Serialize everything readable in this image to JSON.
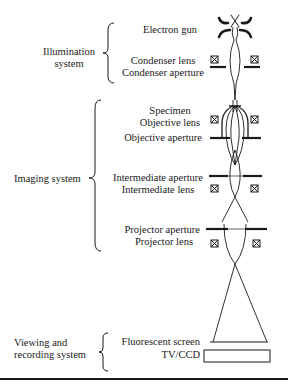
{
  "diagram": {
    "type": "transmission-electron-microscope-schematic",
    "groups": [
      {
        "label_line1": "Illumination",
        "label_line2": "system",
        "components": [
          "Electron gun",
          "Condenser lens",
          "Condenser aperture"
        ]
      },
      {
        "label_line1": "Imaging system",
        "components": [
          "Specimen",
          "Objective lens",
          "Objective aperture",
          "Intermediate aperture",
          "Intermediate lens",
          "Projector aperture",
          "Projector lens"
        ]
      },
      {
        "label_line1": "Viewing and",
        "label_line2": "recording system",
        "components": [
          "Fluorescent screen",
          "TV/CCD"
        ]
      }
    ],
    "components": {
      "electron_gun": "Electron gun",
      "condenser_lens": "Condenser lens",
      "condenser_aperture": "Condenser aperture",
      "specimen": "Specimen",
      "objective_lens": "Objective lens",
      "objective_aperture": "Objective aperture",
      "intermediate_aperture": "Intermediate aperture",
      "intermediate_lens": "Intermediate lens",
      "projector_aperture": "Projector aperture",
      "projector_lens": "Projector lens",
      "fluorescent_screen": "Fluorescent screen",
      "tv_ccd": "TV/CCD"
    },
    "colors": {
      "ink": "#1a1a1a",
      "background": "#ffffff"
    }
  }
}
